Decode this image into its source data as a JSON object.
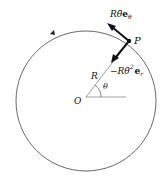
{
  "diagram": {
    "type": "circular-motion-acceleration",
    "labels": {
      "tangential_prefix": "Rθ̈",
      "tangential_vec": "e",
      "tangential_sub": "θ",
      "radial_prefix": "−Rθ̇",
      "radial_sup": "2",
      "radial_vec": "e",
      "radial_sub": "r",
      "point": "P",
      "origin": "O",
      "radius": "R",
      "angle": "θ"
    },
    "colors": {
      "stroke": "#222222",
      "circle": "#444444",
      "arrow": "#111111"
    }
  }
}
